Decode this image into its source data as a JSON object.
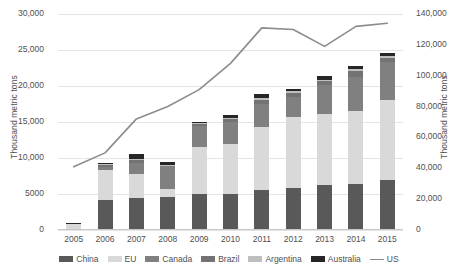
{
  "chart_data": {
    "type": "bar",
    "title": "",
    "subtitle": "",
    "xlabel": "",
    "ylabel": "Thousand metric tons",
    "y2label": "Thousand metric tons",
    "categories": [
      "2005",
      "2006",
      "2007",
      "2008",
      "2009",
      "2010",
      "2011",
      "2012",
      "2013",
      "2014",
      "2015"
    ],
    "ylim": [
      0,
      30000
    ],
    "y2lim": [
      0,
      140000
    ],
    "yticks": [
      "0",
      "5000",
      "10,000",
      "15,000",
      "20,000",
      "25,000",
      "30,000"
    ],
    "ytick_values": [
      0,
      5000,
      10000,
      15000,
      20000,
      25000,
      30000
    ],
    "y2ticks": [
      "0",
      "20,000",
      "40,000",
      "60,000",
      "80,000",
      "100,000",
      "120,000",
      "140,000"
    ],
    "y2tick_values": [
      0,
      20000,
      40000,
      60000,
      80000,
      100000,
      120000,
      140000
    ],
    "grid": true,
    "stacked": true,
    "legend_position": "bottom",
    "series": [
      {
        "name": "China",
        "color": "#595959",
        "axis": "left",
        "type": "bar",
        "values": [
          0,
          4200,
          4450,
          4650,
          4950,
          5050,
          5500,
          5850,
          6200,
          6400,
          6900
        ]
      },
      {
        "name": "EU",
        "color": "#d9d9d9",
        "axis": "left",
        "type": "bar",
        "values": [
          900,
          4100,
          3400,
          1100,
          6600,
          6950,
          8750,
          9900,
          9950,
          10100,
          11100
        ]
      },
      {
        "name": "Canada",
        "color": "#808080",
        "axis": "left",
        "type": "bar",
        "values": [
          0,
          500,
          1500,
          3100,
          2950,
          2950,
          3200,
          2750,
          3950,
          4700,
          5300
        ]
      },
      {
        "name": "Brazil",
        "color": "#737373",
        "axis": "left",
        "type": "bar",
        "values": [
          0,
          250,
          400,
          100,
          250,
          450,
          650,
          500,
          600,
          900,
          550
        ]
      },
      {
        "name": "Argentina",
        "color": "#bfbfbf",
        "axis": "left",
        "type": "bar",
        "values": [
          0,
          100,
          150,
          100,
          150,
          200,
          300,
          250,
          200,
          250,
          300
        ]
      },
      {
        "name": "Australia",
        "color": "#262626",
        "axis": "left",
        "type": "bar",
        "values": [
          100,
          200,
          600,
          400,
          150,
          400,
          500,
          350,
          450,
          500,
          500
        ]
      },
      {
        "name": "US",
        "color": "#8c8c8c",
        "axis": "right",
        "type": "line",
        "values": [
          41000,
          50000,
          72000,
          80000,
          91000,
          108000,
          131000,
          130000,
          119000,
          132000,
          134000
        ]
      }
    ]
  },
  "legend": {
    "items": [
      {
        "label": "China",
        "marker": "swatch"
      },
      {
        "label": "EU",
        "marker": "swatch"
      },
      {
        "label": "Canada",
        "marker": "swatch"
      },
      {
        "label": "Brazil",
        "marker": "swatch"
      },
      {
        "label": "Argentina",
        "marker": "swatch"
      },
      {
        "label": "Australia",
        "marker": "swatch"
      },
      {
        "label": "US",
        "marker": "line"
      }
    ]
  }
}
